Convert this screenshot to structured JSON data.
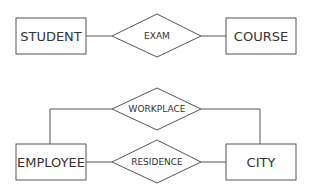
{
  "diagram": {
    "type": "entity-relationship",
    "entities": [
      {
        "id": "student",
        "label": "Student",
        "display": "STUDENT"
      },
      {
        "id": "course",
        "label": "Course",
        "display": "COURSE"
      },
      {
        "id": "employee",
        "label": "Employee",
        "display": "EMPLOYEE"
      },
      {
        "id": "city",
        "label": "City",
        "display": "CITY"
      }
    ],
    "relationships": [
      {
        "id": "exam",
        "label": "Exam",
        "display": "EXAM",
        "connects": [
          "student",
          "course"
        ]
      },
      {
        "id": "workplace",
        "label": "WorkPlace",
        "display": "WORKPLACE",
        "connects": [
          "employee",
          "city"
        ]
      },
      {
        "id": "residence",
        "label": "Residence",
        "display": "RESIDENCE",
        "connects": [
          "employee",
          "city"
        ]
      }
    ],
    "colors": {
      "stroke": "#555555",
      "text": "#333333",
      "background": "#ffffff"
    }
  }
}
